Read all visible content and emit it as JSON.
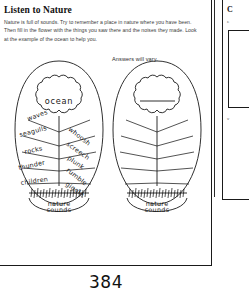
{
  "worksheet": {
    "title": "Listen to Nature",
    "instructions": "Nature is full of sounds. Try to remember a place in nature where you have been. Then fill in the flower with the things you saw there and the noises they made. Look at the example of the ocean to help you.",
    "answers_note": "Answers will vary.",
    "page_number": "384"
  },
  "example_diagram": {
    "name": "ocean-example-flower",
    "head_label": "ocean",
    "root_label_line1": "nature",
    "root_label_line2": "sounds",
    "branches": [
      {
        "thing": "waves",
        "sound": "whoosh"
      },
      {
        "thing": "seagulls",
        "sound": "screech"
      },
      {
        "thing": "rocks",
        "sound": "plunk"
      },
      {
        "thing": "thunder",
        "sound": "rumble"
      },
      {
        "thing": "children",
        "sound": "giggle"
      }
    ]
  },
  "blank_diagram": {
    "name": "blank-student-flower",
    "head_label": "",
    "root_label_line1": "nature",
    "root_label_line2": "sounds",
    "branches": [
      {
        "thing": "",
        "sound": ""
      },
      {
        "thing": "",
        "sound": ""
      },
      {
        "thing": "",
        "sound": ""
      },
      {
        "thing": "",
        "sound": ""
      },
      {
        "thing": "",
        "sound": ""
      }
    ]
  },
  "next_page_sliver": {
    "title": "C",
    "subtitle": "c",
    "footnote": "v"
  },
  "colors": {
    "ink": "#1a1a1a",
    "paper": "#ffffff",
    "body_text": "#3a3a3a"
  }
}
